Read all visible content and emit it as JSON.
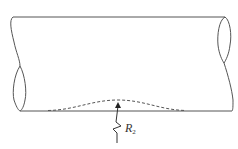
{
  "figure": {
    "label": {
      "symbol": "R",
      "subscript": "2"
    },
    "colors": {
      "stroke": "#555555",
      "dashed": "#555555",
      "background": "#ffffff"
    }
  }
}
